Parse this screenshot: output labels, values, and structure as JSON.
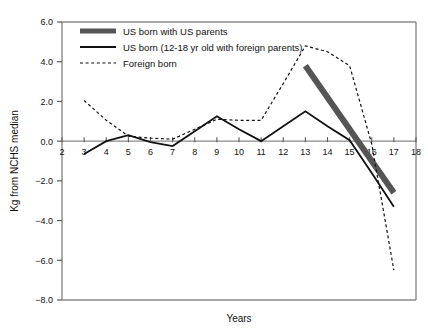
{
  "chart_data": {
    "type": "line",
    "title": "",
    "xlabel": "Years",
    "ylabel": "Kg from NCHS median",
    "xlim": [
      2,
      18
    ],
    "ylim": [
      -8.0,
      6.0
    ],
    "grid": false,
    "legend_position": "top-left",
    "xticks": [
      2,
      3,
      4,
      5,
      6,
      7,
      8,
      9,
      10,
      11,
      12,
      13,
      14,
      15,
      16,
      17,
      18
    ],
    "xtick_labels": [
      "2",
      "3",
      "4",
      "5",
      "6",
      "7",
      "8",
      "9",
      "10",
      "11",
      "12",
      "13",
      "14",
      "15",
      "16",
      "17",
      "18"
    ],
    "yticks": [
      6.0,
      4.0,
      2.0,
      0.0,
      -2.0,
      -4.0,
      -6.0,
      -8.0
    ],
    "ytick_labels": [
      "6.0",
      "4.0",
      "2.0",
      "0.0",
      "−2.0",
      "−4.0",
      "−6.0",
      "−8.0"
    ],
    "zero_line": 0.0,
    "series": [
      {
        "name": "US born with US parents",
        "style": "thick-solid",
        "color": "#555555",
        "width": 6,
        "x": [
          13,
          17
        ],
        "values": [
          3.8,
          -2.6
        ]
      },
      {
        "name": "US born (12-18 yr old with foreign parents)",
        "style": "solid",
        "color": "#111111",
        "width": 1.8,
        "x": [
          3,
          4,
          5,
          6,
          7,
          8,
          9,
          10,
          11,
          12,
          13,
          14,
          15,
          16,
          17
        ],
        "values": [
          -0.65,
          0.0,
          0.3,
          -0.05,
          -0.25,
          0.5,
          1.25,
          0.6,
          0.0,
          0.75,
          1.5,
          0.75,
          0.05,
          -1.6,
          -3.3
        ]
      },
      {
        "name": "Foreign born",
        "style": "dashed",
        "color": "#111111",
        "width": 1.2,
        "x": [
          3,
          4,
          5,
          6,
          7,
          8,
          9,
          10,
          11,
          12,
          13,
          14,
          15,
          16,
          17
        ],
        "values": [
          2.05,
          1.05,
          0.25,
          0.15,
          0.1,
          0.6,
          1.1,
          1.05,
          1.05,
          2.9,
          4.8,
          4.5,
          3.8,
          -0.15,
          -6.5
        ]
      }
    ]
  },
  "legend": {
    "items": [
      {
        "label": "US born with US parents",
        "key": "thick-solid"
      },
      {
        "label": "US born (12-18 yr old with foreign parents)",
        "key": "solid"
      },
      {
        "label": "Foreign born",
        "key": "dashed"
      }
    ]
  }
}
